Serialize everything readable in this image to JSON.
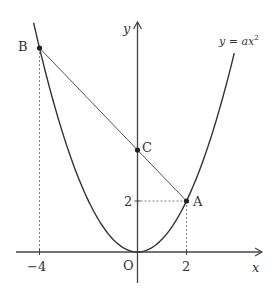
{
  "diagram": {
    "type": "coordinate-geometry",
    "curve": {
      "equation_label": "y = ax²",
      "equation_parts": {
        "lhs": "y",
        "eq": " = ",
        "coef": "a",
        "var": "x",
        "exp": "2"
      },
      "a": 0.5,
      "x_range": [
        -4.24,
        3.95
      ]
    },
    "axes": {
      "x_label": "x",
      "y_label": "y",
      "origin_label": "O"
    },
    "points": [
      {
        "name": "A",
        "x": 2,
        "y": 2
      },
      {
        "name": "B",
        "x": -4,
        "y": 8
      },
      {
        "name": "C",
        "x": 0,
        "y": 4
      }
    ],
    "ticks": {
      "x": [
        {
          "value": -4,
          "label": "−4"
        },
        {
          "value": 2,
          "label": "2"
        }
      ],
      "y": [
        {
          "value": 2,
          "label": "2"
        }
      ]
    },
    "segments": [
      {
        "from": "B",
        "to": "A",
        "label": "line AB through C"
      }
    ],
    "guides": [
      {
        "type": "dashed",
        "from": [
          -4,
          8
        ],
        "to": [
          -4,
          0
        ]
      },
      {
        "type": "dashed",
        "from": [
          2,
          2
        ],
        "to": [
          2,
          0
        ]
      },
      {
        "type": "dashed",
        "from": [
          2,
          2
        ],
        "to": [
          0,
          2
        ]
      }
    ],
    "colors": {
      "line": "#333333",
      "curve": "#333333",
      "guide": "#777777",
      "background": "#ffffff"
    }
  }
}
